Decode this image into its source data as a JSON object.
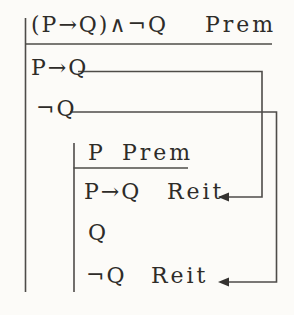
{
  "proof": {
    "outer": {
      "premise": {
        "formula": "(P→Q)∧¬Q",
        "justification": "Prem"
      },
      "line_conditional": {
        "formula": "P→Q"
      },
      "line_negation": {
        "formula": "¬Q"
      }
    },
    "subproof": {
      "premise": {
        "formula": "P",
        "justification": "Prem"
      },
      "line_conditional": {
        "formula": "P→Q",
        "justification": "Reit"
      },
      "line_q": {
        "formula": "Q"
      },
      "line_negation": {
        "formula": "¬Q",
        "justification": "Reit"
      }
    }
  },
  "colors": {
    "background": "#fcfbf8",
    "ink": "#2e2c29",
    "rule_lines": "#4e4c49"
  }
}
